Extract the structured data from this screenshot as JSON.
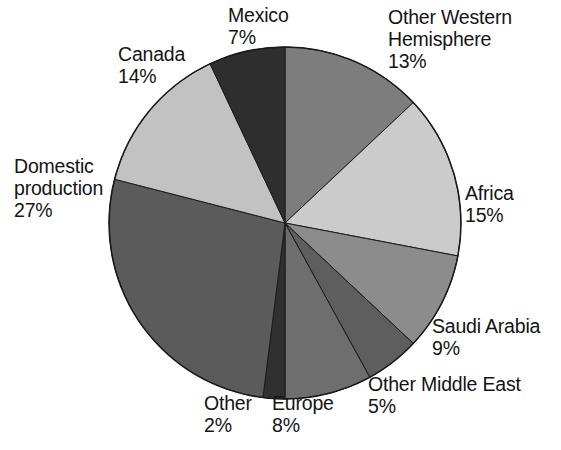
{
  "chart_data": {
    "type": "pie",
    "title": "",
    "subtitle": "",
    "xlabel": "",
    "ylabel": "",
    "legend_position": "none",
    "grid": false,
    "units": "percent",
    "total": 100,
    "start_angle_deg": 0,
    "direction": "clockwise",
    "center": {
      "x": 285,
      "y": 223
    },
    "radius": 176,
    "categories": [
      "Other Western Hemisphere",
      "Africa",
      "Saudi Arabia",
      "Other Middle East",
      "Europe",
      "Other",
      "Domestic production",
      "Canada",
      "Mexico"
    ],
    "values": [
      13,
      15,
      9,
      5,
      8,
      2,
      27,
      14,
      7
    ],
    "slices": [
      {
        "name": "Other Western Hemisphere",
        "label": "Other Western Hemisphere",
        "label_line1": "Other Western",
        "label_line2": "Hemisphere",
        "value": 13,
        "value_label": "13%",
        "color": "#7d7d7d",
        "start_deg": 0,
        "end_deg": 46.8
      },
      {
        "name": "Africa",
        "label": "Africa",
        "value": 15,
        "value_label": "15%",
        "color": "#cbcbcb",
        "start_deg": 46.8,
        "end_deg": 100.8
      },
      {
        "name": "Saudi Arabia",
        "label": "Saudi Arabia",
        "value": 9,
        "value_label": "9%",
        "color": "#8c8c8c",
        "start_deg": 100.8,
        "end_deg": 133.2
      },
      {
        "name": "Other Middle East",
        "label": "Other Middle East",
        "value": 5,
        "value_label": "5%",
        "color": "#5e5e5e",
        "start_deg": 133.2,
        "end_deg": 151.2
      },
      {
        "name": "Europe",
        "label": "Europe",
        "value": 8,
        "value_label": "8%",
        "color": "#6e6e6e",
        "start_deg": 151.2,
        "end_deg": 180.0
      },
      {
        "name": "Other",
        "label": "Other",
        "value": 2,
        "value_label": "2%",
        "color": "#303030",
        "start_deg": 180.0,
        "end_deg": 187.2
      },
      {
        "name": "Domestic production",
        "label": "Domestic production",
        "label_line1": "Domestic",
        "label_line2": "production",
        "value": 27,
        "value_label": "27%",
        "color": "#5b5b5b",
        "start_deg": 187.2,
        "end_deg": 284.4
      },
      {
        "name": "Canada",
        "label": "Canada",
        "value": 14,
        "value_label": "14%",
        "color": "#c2c2c2",
        "start_deg": 284.4,
        "end_deg": 334.8
      },
      {
        "name": "Mexico",
        "label": "Mexico",
        "value": 7,
        "value_label": "7%",
        "color": "#2e2e2e",
        "start_deg": 334.8,
        "end_deg": 360.0
      }
    ],
    "colors": {
      "background": "#ffffff",
      "text": "#141414",
      "slice_outline": "#1a1a1a"
    }
  },
  "labels": {
    "mexico": {
      "name": "Mexico",
      "value": "7%"
    },
    "other_western": {
      "line1": "Other Western",
      "line2": "Hemisphere",
      "value": "13%"
    },
    "canada": {
      "name": "Canada",
      "value": "14%"
    },
    "domestic": {
      "line1": "Domestic",
      "line2": "production",
      "value": "27%"
    },
    "africa": {
      "name": "Africa",
      "value": "15%"
    },
    "saudi": {
      "name": "Saudi Arabia",
      "value": "9%"
    },
    "other_middle_east": {
      "name": "Other Middle East",
      "value": "5%"
    },
    "other": {
      "name": "Other",
      "value": "2%"
    },
    "europe": {
      "name": "Europe",
      "value": "8%"
    }
  }
}
